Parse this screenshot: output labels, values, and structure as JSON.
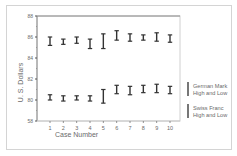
{
  "chart_data": {
    "type": "hi-lo error bars",
    "title": "",
    "xlabel": "Case Number",
    "ylabel": "U. S. Dollars",
    "categories": [
      "1",
      "2",
      "3",
      "4",
      "5",
      "6",
      "7",
      "8",
      "9",
      "10"
    ],
    "y_ticks": [
      "88",
      "86",
      "84",
      "82",
      "80",
      "58"
    ],
    "ylim": [
      78,
      88
    ],
    "grid": false,
    "legend_position": "right",
    "series": [
      {
        "name": "German Mark High and Low",
        "legend_lines": [
          "German Mark",
          "High and Low"
        ],
        "high": [
          86.0,
          85.8,
          86.0,
          85.8,
          86.3,
          86.6,
          86.3,
          86.2,
          86.4,
          86.2
        ],
        "low": [
          85.2,
          85.3,
          85.4,
          84.9,
          84.9,
          85.7,
          85.6,
          85.7,
          85.6,
          85.5
        ]
      },
      {
        "name": "Swiss Franc High and Low",
        "legend_lines": [
          "Swiss Franc",
          "High and Low"
        ],
        "high": [
          80.5,
          80.4,
          80.4,
          80.4,
          81.0,
          81.4,
          81.3,
          81.4,
          81.5,
          81.3
        ],
        "low": [
          80.0,
          79.9,
          80.0,
          79.9,
          79.7,
          80.6,
          80.5,
          80.7,
          80.7,
          80.6
        ]
      }
    ]
  }
}
